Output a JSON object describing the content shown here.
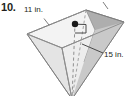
{
  "exercise": {
    "number": "10."
  },
  "figure": {
    "solid_name": "rectangular-pyramid",
    "orientation": "apex-down",
    "labels": {
      "base_edge": "11 in.",
      "lateral_edge": "15 in."
    },
    "annotations": {
      "center_point": "apex-projection-dot",
      "right_angle_mark": "right-angle-symbol",
      "altitude": "dashed-height-segment",
      "hidden_edges": "dashed-hidden-edges",
      "tick_base_edge": "tick-mark-left-top-edge",
      "tick_back_edge": "tick-mark-right-top-edge",
      "leader_lateral_edge": "leader-line-to-lateral-edge"
    },
    "colors": {
      "outline": "#7d7d7d",
      "face_top": "#f2f2f2",
      "face_front_left": "#e6e6e6",
      "face_front_right": "#ededed",
      "face_right_dark": "#a9a9a9",
      "face_right_mid": "#c4c4c4",
      "text": "#231f20",
      "dashed": "#9a9a9a",
      "background": "#ffffff"
    }
  }
}
